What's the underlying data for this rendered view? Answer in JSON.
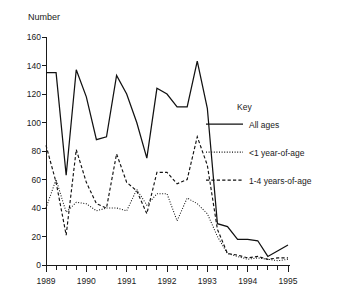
{
  "chart_data": {
    "type": "line",
    "title": "",
    "subtitle": "",
    "ylabel": "Number",
    "xlabel": "",
    "ylim": [
      0,
      160
    ],
    "xlim": [
      1989,
      1995
    ],
    "grid": false,
    "legend_position": "right",
    "y_ticks": [
      0,
      20,
      40,
      60,
      80,
      100,
      120,
      140,
      160
    ],
    "y_tick_labels": [
      "0",
      "20",
      "40",
      "60",
      "80",
      "100",
      "120",
      "140",
      "160"
    ],
    "x_ticks": [
      1989,
      1990,
      1991,
      1992,
      1993,
      1994,
      1995
    ],
    "x_tick_labels": [
      "1989",
      "1990",
      "1991",
      "1992",
      "1993",
      "1994",
      "1995"
    ],
    "x_minor_tick_interval": 0.25,
    "x": [
      1989.0,
      1989.25,
      1989.5,
      1989.75,
      1990.0,
      1990.25,
      1990.5,
      1990.75,
      1991.0,
      1991.25,
      1991.5,
      1991.75,
      1992.0,
      1992.25,
      1992.5,
      1992.75,
      1993.0,
      1993.25,
      1993.5,
      1993.75,
      1994.0,
      1994.25,
      1994.5,
      1994.75,
      1995.0
    ],
    "series": [
      {
        "name": "All ages",
        "style": "solid",
        "color": "#111111",
        "values": [
          135,
          135,
          63,
          137,
          118,
          88,
          90,
          133,
          120,
          100,
          75,
          124,
          120,
          111,
          111,
          143,
          110,
          29,
          27,
          18,
          18,
          17,
          6,
          10,
          14
        ]
      },
      {
        "name": "<1 year-of-age",
        "style": "dotted",
        "color": "#111111",
        "values": [
          40,
          60,
          37,
          44,
          43,
          38,
          40,
          40,
          38,
          53,
          42,
          50,
          50,
          31,
          47,
          43,
          36,
          20,
          8,
          6,
          4,
          5,
          4,
          3,
          4
        ]
      },
      {
        "name": "1-4 years-of-age",
        "style": "dashed",
        "color": "#111111",
        "values": [
          84,
          58,
          21,
          81,
          58,
          43,
          40,
          78,
          58,
          52,
          36,
          65,
          65,
          57,
          60,
          90,
          70,
          25,
          8,
          7,
          5,
          6,
          4,
          5,
          5
        ]
      }
    ]
  },
  "legend": {
    "title": "Key",
    "entries": [
      {
        "label": "All ages",
        "style": "solid"
      },
      {
        "label": "<1 year-of-age",
        "style": "dotted"
      },
      {
        "label": "1-4 years-of-age",
        "style": "dashed"
      }
    ]
  },
  "axes": {
    "y_axis_label": "Number"
  }
}
